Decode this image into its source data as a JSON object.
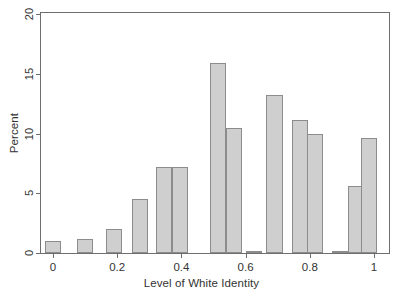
{
  "chart_data": {
    "type": "bar",
    "title": "",
    "subtitle": "",
    "xlabel": "Level of White Identity",
    "ylabel": "Percent",
    "xlim": [
      -0.04,
      1.04
    ],
    "ylim": [
      0,
      20
    ],
    "xticks": [
      0,
      0.2,
      0.4,
      0.6,
      0.8,
      1
    ],
    "xtick_labels": [
      "0",
      "0.2",
      "0.4",
      "0.6",
      "0.8",
      "1"
    ],
    "yticks": [
      0,
      5,
      10,
      15,
      20
    ],
    "ytick_labels": [
      "0",
      "5",
      "10",
      "15",
      "20"
    ],
    "grid": false,
    "legend": "none",
    "bar_color": "#cfcfcf",
    "bar_edge_color": "#8c8c8c",
    "axis_color": "#6e6e6e",
    "bar_width": 0.05,
    "x": [
      0.0,
      0.1,
      0.19,
      0.27,
      0.345,
      0.395,
      0.515,
      0.565,
      0.625,
      0.69,
      0.77,
      0.815,
      0.895,
      0.945,
      0.985
    ],
    "values": [
      1.0,
      1.2,
      2.0,
      4.5,
      7.2,
      7.2,
      15.9,
      10.5,
      0.15,
      13.2,
      11.1,
      10.0,
      0.15,
      5.6,
      9.6
    ],
    "categories": [
      "0.00",
      "0.10",
      "0.19",
      "0.27",
      "0.35",
      "0.40",
      "0.52",
      "0.57",
      "0.63",
      "0.69",
      "0.77",
      "0.82",
      "0.90",
      "0.95",
      "0.99"
    ]
  }
}
